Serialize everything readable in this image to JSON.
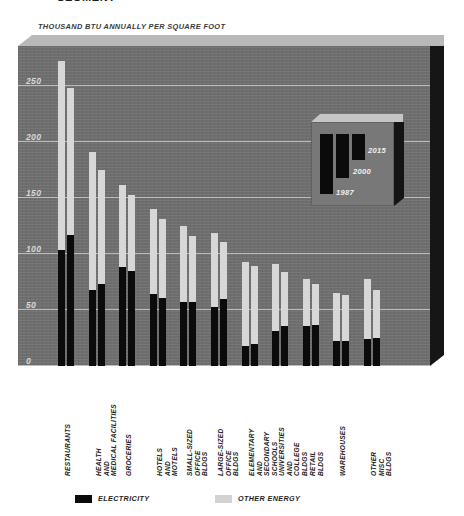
{
  "headline": "SEGMENT",
  "units_caption": "THOUSAND BTU ANNUALLY PER SQUARE FOOT",
  "legend": {
    "electricity_label": "ELECTRICITY",
    "other_label": "OTHER ENERGY",
    "electricity_color": "#0b0b0b",
    "other_color": "#d2d2d2"
  },
  "inset": {
    "years": [
      "2015",
      "2000",
      "1987"
    ],
    "bar_color": "#0b0b0b",
    "panel_color": "#787878"
  },
  "axis": {
    "ticks": [
      "250",
      "200",
      "150",
      "100",
      "50",
      "0"
    ]
  },
  "chart_data": {
    "type": "bar",
    "title": "SEGMENT",
    "subtitle": "THOUSAND BTU ANNUALLY PER SQUARE FOOT",
    "xlabel": "",
    "ylabel": "THOUSAND BTU ANNUALLY PER SQUARE FOOT",
    "ylim": [
      0,
      275
    ],
    "yticks": [
      0,
      50,
      100,
      150,
      200,
      250
    ],
    "grid": true,
    "legend_position": "bottom",
    "stacked": true,
    "group_years": [
      "1987",
      "2015"
    ],
    "categories": [
      "RESTAURANTS",
      "HEALTH AND MEDICAL FACILITIES",
      "GROCERIES",
      "HOTELS AND MOTELS",
      "SMALL-SIZED OFFICE BLDGS",
      "LARGE-SIZED OFFICE BLDGS",
      "ELEMENTARY AND SECONDARY SCHOOLS",
      "UNIVERSITIES AND COLLEGE BLDGS",
      "RETAIL BLDGS",
      "WAREHOUSES",
      "OTHER MISC BLDGS"
    ],
    "series": [
      {
        "name": "ELECTRICITY",
        "color": "#0b0b0b",
        "bars": [
          [
            104,
            117
          ],
          [
            68,
            73
          ],
          [
            88,
            85
          ],
          [
            64,
            61
          ],
          [
            57,
            57
          ],
          [
            53,
            60
          ],
          [
            18,
            20
          ],
          [
            31,
            36
          ],
          [
            36,
            37
          ],
          [
            22,
            22
          ],
          [
            24,
            25
          ]
        ]
      },
      {
        "name": "OTHER ENERGY",
        "color": "#d7d7d7",
        "bars": [
          [
            168,
            131
          ],
          [
            123,
            102
          ],
          [
            74,
            68
          ],
          [
            76,
            70
          ],
          [
            68,
            59
          ],
          [
            66,
            51
          ],
          [
            75,
            69
          ],
          [
            60,
            48
          ],
          [
            42,
            36
          ],
          [
            43,
            41
          ],
          [
            54,
            43
          ]
        ]
      },
      {
        "name": "TOTAL",
        "color": "",
        "bars": [
          [
            272,
            248
          ],
          [
            191,
            175
          ],
          [
            162,
            153
          ],
          [
            140,
            131
          ],
          [
            125,
            116
          ],
          [
            119,
            111
          ],
          [
            93,
            89
          ],
          [
            91,
            84
          ],
          [
            78,
            73
          ],
          [
            65,
            63
          ],
          [
            78,
            68
          ]
        ]
      }
    ]
  }
}
